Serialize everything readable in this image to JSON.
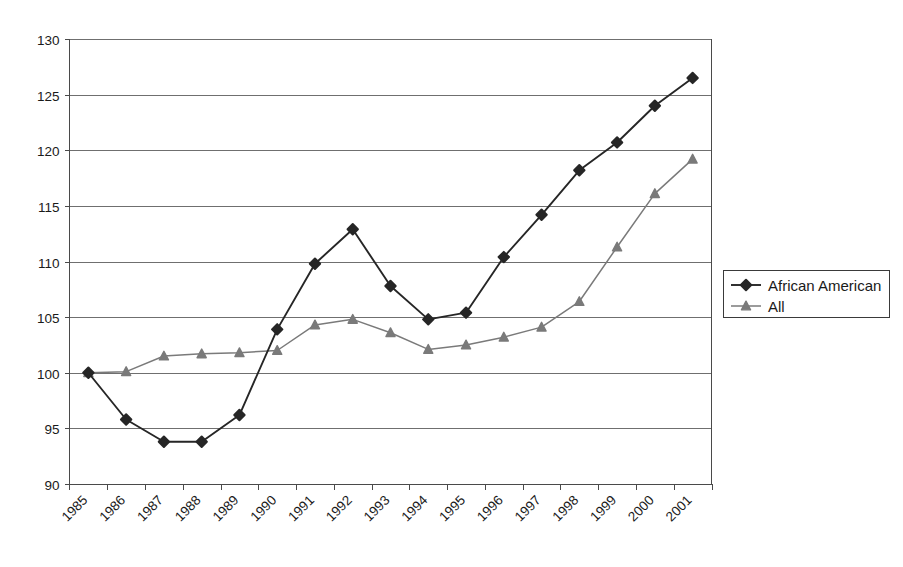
{
  "chart_data": {
    "type": "line",
    "title": "",
    "xlabel": "",
    "ylabel": "",
    "categories": [
      "1985",
      "1986",
      "1987",
      "1988",
      "1989",
      "1990",
      "1991",
      "1992",
      "1993",
      "1994",
      "1995",
      "1996",
      "1997",
      "1998",
      "1999",
      "2000",
      "2001"
    ],
    "ylim": [
      90,
      130
    ],
    "ytick_step": 5,
    "yticks": [
      "90",
      "95",
      "100",
      "105",
      "110",
      "115",
      "120",
      "125",
      "130"
    ],
    "grid": "horizontal",
    "legend_position": "right",
    "series": [
      {
        "name": "African American",
        "color": "#262626",
        "marker": "diamond",
        "values": [
          100.0,
          95.8,
          93.8,
          93.8,
          96.2,
          103.9,
          109.8,
          112.9,
          107.8,
          104.8,
          105.4,
          110.4,
          114.2,
          118.2,
          120.7,
          124.0,
          126.5
        ]
      },
      {
        "name": "All",
        "color": "#7a7a7a",
        "marker": "triangle",
        "values": [
          100.0,
          100.1,
          101.5,
          101.7,
          101.8,
          102.0,
          104.3,
          104.8,
          103.6,
          102.1,
          102.5,
          103.2,
          104.1,
          106.4,
          111.3,
          116.1,
          119.2
        ]
      }
    ]
  },
  "legend": {
    "entries": [
      {
        "label": "African American"
      },
      {
        "label": "All"
      }
    ]
  }
}
